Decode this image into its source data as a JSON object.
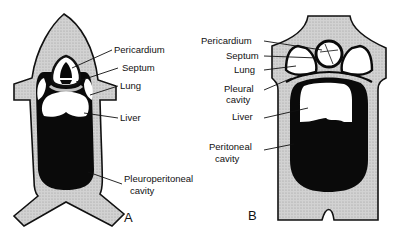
{
  "figure": {
    "colors": {
      "body_wall": "#cfcfcf",
      "cavity": "#0a0a0a",
      "organ": "#ffffff",
      "outline": "#111111"
    },
    "panel_a": {
      "letter": "A",
      "labels": {
        "pericardium": "Pericardium",
        "septum": "Septum",
        "lung": "Lung",
        "liver": "Liver",
        "pleuroperitoneal_1": "Pleuroperitoneal",
        "pleuroperitoneal_2": "cavity"
      }
    },
    "panel_b": {
      "letter": "B",
      "labels": {
        "pericardium": "Pericardium",
        "septum": "Septum",
        "lung": "Lung",
        "pleural_1": "Pleural",
        "pleural_2": "cavity",
        "liver": "Liver",
        "peritoneal_1": "Peritoneal",
        "peritoneal_2": "cavity"
      }
    }
  }
}
